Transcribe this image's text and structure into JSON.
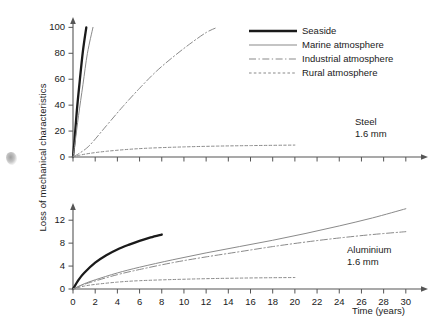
{
  "figure": {
    "ylabel": "Loss of mechanical characteristics",
    "xlabel": "Time (years)",
    "colors": {
      "axis": "#555555",
      "seaside": "#1a1a1a",
      "marine": "#8a8a8a",
      "industrial": "#8a8a8a",
      "rural": "#8a8a8a",
      "text": "#1a1a1a"
    }
  },
  "legend": {
    "position": "top-right",
    "items": [
      {
        "label": "Seaside",
        "style": "solid-thick",
        "color": "#1a1a1a"
      },
      {
        "label": "Marine atmosphere",
        "style": "solid-thin",
        "color": "#8a8a8a"
      },
      {
        "label": "Industrial atmosphere",
        "style": "dash-dot",
        "color": "#8a8a8a"
      },
      {
        "label": "Rural atmosphere",
        "style": "dotted",
        "color": "#8a8a8a"
      }
    ]
  },
  "chart_data": [
    {
      "type": "line",
      "title": "",
      "annotation": [
        "Steel",
        "1.6 mm"
      ],
      "xlabel": "",
      "ylabel": "Loss of mechanical characteristics",
      "xlim": [
        0,
        32
      ],
      "ylim": [
        0,
        108
      ],
      "xticks": [
        0,
        2,
        4,
        6,
        8,
        10,
        12,
        14,
        16,
        18,
        20,
        22,
        24,
        26,
        28,
        30
      ],
      "yticks": [
        0,
        20,
        40,
        60,
        80,
        100
      ],
      "xtick_labels": [
        "",
        "",
        "",
        "",
        "",
        "",
        "",
        "",
        "",
        "",
        "",
        "",
        "",
        "",
        "",
        ""
      ],
      "ytick_labels": [
        "0",
        "20",
        "40",
        "60",
        "80",
        "100"
      ],
      "grid": false,
      "series": [
        {
          "name": "Seaside",
          "style": "solid-thick",
          "color": "#1a1a1a",
          "x": [
            0,
            0.15,
            0.35,
            0.6,
            0.9,
            1.2
          ],
          "y": [
            0,
            14,
            36,
            58,
            82,
            100
          ]
        },
        {
          "name": "Marine atmosphere",
          "style": "solid-thin",
          "color": "#8a8a8a",
          "x": [
            0,
            0.2,
            0.5,
            0.9,
            1.3,
            1.8
          ],
          "y": [
            0,
            12,
            32,
            56,
            80,
            100
          ]
        },
        {
          "name": "Industrial atmosphere",
          "style": "dash-dot",
          "color": "#8a8a8a",
          "x": [
            0,
            0.6,
            1.5,
            3,
            4.5,
            6,
            7.5,
            9,
            10.5,
            12,
            13
          ],
          "y": [
            0,
            3,
            9,
            24,
            39,
            53,
            66,
            77,
            87,
            96,
            100
          ]
        },
        {
          "name": "Rural atmosphere",
          "style": "dotted",
          "color": "#8a8a8a",
          "x": [
            0,
            0.5,
            1.5,
            3,
            5,
            7,
            10,
            13,
            16,
            20
          ],
          "y": [
            0,
            1.2,
            2.8,
            4.4,
            5.9,
            6.9,
            7.8,
            8.4,
            8.8,
            9.2
          ]
        }
      ]
    },
    {
      "type": "line",
      "title": "",
      "annotation": [
        "Aluminium",
        "1.6 mm"
      ],
      "xlabel": "Time (years)",
      "ylabel": "Loss of mechanical characteristics",
      "xlim": [
        0,
        32
      ],
      "ylim": [
        0,
        15
      ],
      "xticks": [
        0,
        2,
        4,
        6,
        8,
        10,
        12,
        14,
        16,
        18,
        20,
        22,
        24,
        26,
        28,
        30
      ],
      "yticks": [
        0,
        4,
        8,
        12
      ],
      "xtick_labels": [
        "0",
        "2",
        "4",
        "6",
        "8",
        "10",
        "12",
        "14",
        "16",
        "18",
        "20",
        "22",
        "24",
        "26",
        "28",
        "30"
      ],
      "ytick_labels": [
        "0",
        "4",
        "8",
        "12"
      ],
      "grid": false,
      "series": [
        {
          "name": "Seaside",
          "style": "solid-thick",
          "color": "#1a1a1a",
          "x": [
            0,
            0.5,
            1,
            2,
            3,
            4,
            5,
            6,
            7,
            8
          ],
          "y": [
            0,
            1.6,
            2.8,
            4.6,
            5.9,
            6.9,
            7.7,
            8.4,
            9.0,
            9.5
          ]
        },
        {
          "name": "Marine atmosphere",
          "style": "solid-thin",
          "color": "#8a8a8a",
          "x": [
            0,
            1,
            2,
            4,
            6,
            9,
            12,
            15,
            18,
            21,
            24,
            27,
            30
          ],
          "y": [
            0,
            0.9,
            1.6,
            2.8,
            3.8,
            5.1,
            6.3,
            7.4,
            8.5,
            9.7,
            11.0,
            12.4,
            14.0
          ]
        },
        {
          "name": "Industrial atmosphere",
          "style": "dash-dot",
          "color": "#8a8a8a",
          "x": [
            0,
            1,
            2,
            4,
            6,
            9,
            12,
            15,
            18,
            21,
            24,
            27,
            30
          ],
          "y": [
            0,
            0.8,
            1.4,
            2.5,
            3.4,
            4.6,
            5.6,
            6.5,
            7.4,
            8.2,
            8.9,
            9.5,
            10.0
          ]
        },
        {
          "name": "Rural atmosphere",
          "style": "dotted",
          "color": "#8a8a8a",
          "x": [
            0,
            1,
            2,
            4,
            6,
            9,
            12,
            15,
            18,
            20
          ],
          "y": [
            0,
            0.5,
            0.8,
            1.2,
            1.45,
            1.65,
            1.8,
            1.9,
            1.97,
            2.0
          ]
        }
      ]
    }
  ]
}
